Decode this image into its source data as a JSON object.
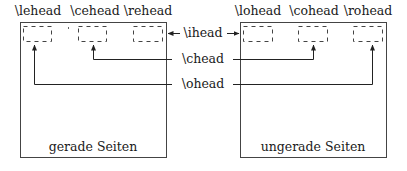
{
  "diagram": {
    "even_page": {
      "caption": "gerade Seiten",
      "headers": [
        "\\lehead",
        "\\cehead",
        "\\rehead"
      ]
    },
    "odd_page": {
      "caption": "ungerade Seiten",
      "headers": [
        "\\lohead",
        "\\cohead",
        "\\rohead"
      ]
    },
    "connectors": {
      "inner": "\\ihead",
      "center": "\\chead",
      "outer": "\\ohead"
    },
    "colors": {
      "line": "#333333",
      "dash": "#444444",
      "background": "#ffffff"
    }
  }
}
